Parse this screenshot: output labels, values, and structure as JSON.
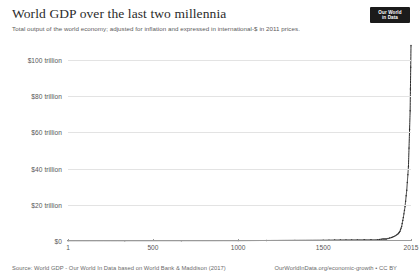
{
  "header": {
    "title": "World GDP over the last two millennia",
    "subtitle": "Total output of the world economy; adjusted for inflation and expressed in international-$ in 2011 prices."
  },
  "logo": {
    "line1": "Our World",
    "line2": "in Data"
  },
  "footer": {
    "source": "Source: World GDP - Our World In Data based on World Bank & Maddison (2017)",
    "license": "OurWorldInData.org/economic-growth • CC BY"
  },
  "colors": {
    "line": "#2b2b2b",
    "grid": "#e3e3e3",
    "axis": "#9a9a9a",
    "text": "#2b2b2b",
    "muted": "#575757",
    "logo_bg": "#1b1b1b"
  },
  "chart_data": {
    "type": "line",
    "title": "World GDP over the last two millennia",
    "subtitle": "Total output of the world economy; adjusted for inflation and expressed in international-$ in 2011 prices.",
    "xlabel": "",
    "ylabel": "",
    "yunit": "international-$ (2011 prices)",
    "xlim": [
      1,
      2015
    ],
    "ylim": [
      0,
      100
    ],
    "grid": true,
    "legend": false,
    "ytick_values": [
      0,
      20,
      40,
      60,
      80,
      100
    ],
    "ytick_labels": [
      "$0",
      "$20 trillion",
      "$40 trillion",
      "$60 trillion",
      "$80 trillion",
      "$100 trillion"
    ],
    "xtick_values": [
      1,
      500,
      1000,
      1500,
      2015
    ],
    "xtick_labels": [
      "1",
      "500",
      "1000",
      "1500",
      "2015"
    ],
    "series": [
      {
        "name": "World GDP",
        "x": [
          1,
          1000,
          1500,
          1600,
          1700,
          1820,
          1850,
          1870,
          1900,
          1920,
          1940,
          1950,
          1960,
          1970,
          1980,
          1990,
          2000,
          2010,
          2015
        ],
        "y": [
          0.18,
          0.21,
          0.43,
          0.58,
          0.64,
          0.69,
          1.1,
          1.1,
          1.9,
          2.7,
          4.0,
          5.3,
          8.0,
          13.0,
          19.0,
          28.0,
          41.0,
          72.0,
          108.0
        ]
      }
    ]
  }
}
